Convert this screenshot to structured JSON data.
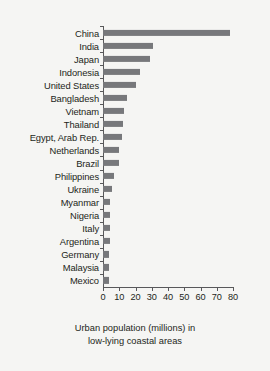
{
  "chart_data": {
    "type": "bar",
    "orientation": "horizontal",
    "title": "",
    "xlabel": "Urban population (millions) in low-lying coastal areas",
    "xlabel_lines": [
      "Urban population (millions) in",
      "low-lying coastal areas"
    ],
    "ylabel": "",
    "xlim": [
      0,
      80
    ],
    "xticks": [
      0,
      10,
      20,
      30,
      40,
      50,
      60,
      70,
      80
    ],
    "xtick_labels": [
      "0",
      "10",
      "20",
      "30",
      "40",
      "50",
      "60",
      "70",
      "80"
    ],
    "grid": false,
    "legend": null,
    "bar_color": "#77787b",
    "background_color": "#f5f5f3",
    "axis_color": "#58585a",
    "categories": [
      "China",
      "India",
      "Japan",
      "Indonesia",
      "United States",
      "Bangladesh",
      "Vietnam",
      "Thailand",
      "Egypt, Arab Rep.",
      "Netherlands",
      "Brazil",
      "Philippines",
      "Ukraine",
      "Myanmar",
      "Nigeria",
      "Italy",
      "Argentina",
      "Germany",
      "Malaysia",
      "Mexico"
    ],
    "values": [
      78,
      31,
      29,
      23,
      20,
      15,
      13,
      12.5,
      11.5,
      10,
      10,
      7,
      5.5,
      4.2,
      4.2,
      4,
      4,
      3.8,
      3.8,
      3.6
    ]
  }
}
